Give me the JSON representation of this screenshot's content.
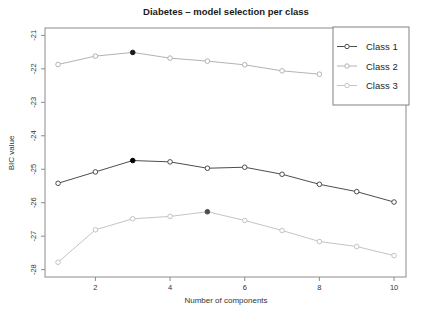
{
  "title": "Diabetes – model selection per class",
  "chart_data": {
    "type": "line",
    "title": "Diabetes – model selection per class",
    "xlabel": "Number of components",
    "ylabel": "BIC value",
    "x": [
      1,
      2,
      3,
      4,
      5,
      6,
      7,
      8,
      9,
      10
    ],
    "xticks": [
      2,
      4,
      6,
      8,
      10
    ],
    "yticks": [
      -28,
      -27,
      -26,
      -25,
      -24,
      -23,
      -22,
      -21
    ],
    "xlim": [
      0.65,
      10.32
    ],
    "ylim": [
      -28.22,
      -20.78
    ],
    "grid": false,
    "legend_position": "top-right",
    "marker": "open-circle",
    "best_marker": "filled-circle",
    "series": [
      {
        "name": "Class 1",
        "color": "#4d4d4d",
        "best_component": 3,
        "best_color": "#000000",
        "values": [
          -25.42,
          -25.08,
          -24.74,
          -24.78,
          -24.97,
          -24.94,
          -25.15,
          -25.45,
          -25.67,
          -25.98
        ]
      },
      {
        "name": "Class 2",
        "color": "#b3b3b3",
        "best_component": 3,
        "best_color": "#1a1a1a",
        "values": [
          -21.87,
          -21.62,
          -21.51,
          -21.68,
          -21.77,
          -21.88,
          -22.06,
          -22.16,
          null,
          null
        ]
      },
      {
        "name": "Class 3",
        "color": "#c4c4c4",
        "best_component": 5,
        "best_color": "#4d4d4d",
        "values": [
          -27.78,
          -26.81,
          -26.48,
          -26.41,
          -26.27,
          -26.53,
          -26.83,
          -27.16,
          -27.31,
          -27.58
        ]
      }
    ]
  },
  "colors": {
    "plot_box": "#8c8c8c",
    "tick": "#8c8c8c",
    "legend_border": "#737373",
    "legend_background": "#ffffff",
    "marker_fill": "#ffffff"
  }
}
